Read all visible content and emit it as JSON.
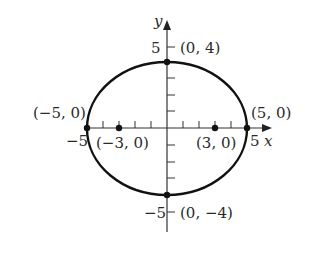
{
  "diagram": {
    "type": "ellipse-graph",
    "equation_params": {
      "a": 5,
      "b": 4,
      "c": 3
    },
    "axes": {
      "x_label": "x",
      "y_label": "y",
      "x_tick_label_neg": "−5",
      "x_tick_label_pos": "5",
      "y_tick_label_pos": "5",
      "y_tick_label_neg": "−5"
    },
    "points": [
      {
        "id": "vertex-left",
        "x": -5,
        "y": 0,
        "label": "(−5, 0)"
      },
      {
        "id": "vertex-right",
        "x": 5,
        "y": 0,
        "label": "(5, 0)"
      },
      {
        "id": "covertex-top",
        "x": 0,
        "y": 4,
        "label": "(0, 4)"
      },
      {
        "id": "covertex-bottom",
        "x": 0,
        "y": -4,
        "label": "(0, −4)"
      },
      {
        "id": "focus-left",
        "x": -3,
        "y": 0,
        "label": "(−3, 0)"
      },
      {
        "id": "focus-right",
        "x": 3,
        "y": 0,
        "label": "(3, 0)"
      }
    ],
    "colors": {
      "curve": "#111111",
      "axes": "#333333",
      "text": "#2a2a2a"
    }
  }
}
